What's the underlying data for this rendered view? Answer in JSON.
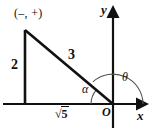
{
  "figure": {
    "background_color": "#ffffff",
    "stroke_color": "#111111"
  },
  "axes": {
    "x_label": "x",
    "y_label": "y",
    "origin_label": "O",
    "x_axis": {
      "start_x": 3,
      "end_x": 143,
      "y": 104,
      "arrow": "right"
    },
    "y_axis": {
      "x": 113,
      "start_y": 128,
      "end_y": 11,
      "arrow": "up"
    }
  },
  "triangle": {
    "vertices": {
      "apex": {
        "x": 25,
        "y": 30
      },
      "right_angle": {
        "x": 25,
        "y": 104
      },
      "origin": {
        "x": 113,
        "y": 104
      }
    },
    "vertical_leg_label": "2",
    "hypotenuse_label": "3",
    "horizontal_leg_label": {
      "radical_sign": "√",
      "radicand": "5",
      "full": "√5"
    },
    "quadrant_label": "(–, +)"
  },
  "angles": {
    "alpha": {
      "symbol": "α",
      "arc_radius": 22
    },
    "theta": {
      "symbol": "θ",
      "arc_radius": 30
    }
  }
}
